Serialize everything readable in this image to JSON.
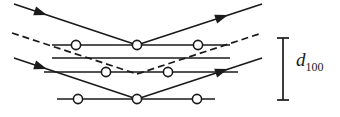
{
  "figure": {
    "type": "bragg-diffraction-diagram",
    "background_color": "#ffffff",
    "stroke_color": "#1a1a1a",
    "width": 340,
    "height": 117
  },
  "labels": {
    "spacing_symbol": "d",
    "spacing_subscript": "100",
    "spacing_full": "d100"
  },
  "dimension_bar": {
    "x": 283,
    "y_top": 38,
    "y_bottom": 100,
    "cap_half_width": 6
  },
  "planes": [
    {
      "name": "plane-1",
      "y": 45,
      "x_start": 52,
      "x_end": 230,
      "atoms_x": [
        76,
        137,
        198
      ]
    },
    {
      "name": "plane-2",
      "y": 58,
      "x_start": 52,
      "x_end": 230,
      "atoms_x": []
    },
    {
      "name": "plane-3",
      "y": 72,
      "x_start": 44,
      "x_end": 238,
      "atoms_x": [
        106,
        168
      ]
    },
    {
      "name": "plane-4",
      "y": 99,
      "x_start": 57,
      "x_end": 215,
      "atoms_x": [
        78,
        137,
        197
      ]
    }
  ],
  "atom_radius": 4.6,
  "rays": [
    {
      "name": "solid-ray-upper",
      "style": "solid",
      "incoming": {
        "x1": 14,
        "y1": 4,
        "x2": 137,
        "y2": 45
      },
      "outgoing": {
        "x1": 137,
        "y1": 45,
        "x2": 262,
        "y2": 4
      },
      "arrowheads": [
        {
          "x": 44,
          "y": 14,
          "angle": 18.4
        },
        {
          "x": 224,
          "y": 17,
          "angle": -18.4
        }
      ]
    },
    {
      "name": "dashed-ray",
      "style": "dashed",
      "incoming": {
        "x1": 12,
        "y1": 33,
        "x2": 137,
        "y2": 74
      },
      "outgoing": {
        "x1": 137,
        "y1": 74,
        "x2": 262,
        "y2": 33
      },
      "dash_pattern": "7,4",
      "arrowheads": []
    },
    {
      "name": "solid-ray-lower",
      "style": "solid",
      "incoming": {
        "x1": 14,
        "y1": 58,
        "x2": 137,
        "y2": 99
      },
      "outgoing": {
        "x1": 137,
        "y1": 99,
        "x2": 262,
        "y2": 58
      },
      "arrowheads": [
        {
          "x": 44,
          "y": 68,
          "angle": 18.4
        },
        {
          "x": 224,
          "y": 71,
          "angle": -18.4
        }
      ]
    }
  ],
  "arrowhead": {
    "length": 13,
    "half_width": 4.6
  }
}
